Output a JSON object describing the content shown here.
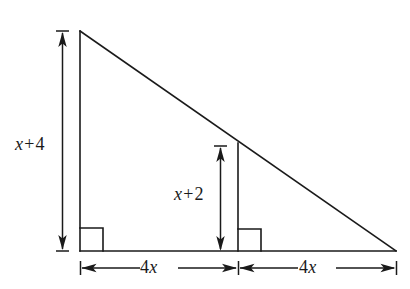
{
  "figure": {
    "kind": "geometry-diagram",
    "background_color": "#ffffff",
    "stroke_color": "#1a1a1a",
    "labels": {
      "left_height": {
        "var": "x",
        "op": "+",
        "num": "4",
        "full": "x + 4"
      },
      "inner_height": {
        "var": "x",
        "op": "+",
        "num": "2",
        "full": "x + 2"
      },
      "base_left": {
        "coef": "4",
        "var": "x",
        "full": "4x"
      },
      "base_right": {
        "coef": "4",
        "var": "x",
        "full": "4x"
      }
    },
    "geometry": {
      "triangle": {
        "apex": [
          80,
          31
        ],
        "bottom_left": [
          80,
          251
        ],
        "bottom_right": [
          396,
          251
        ]
      },
      "altitude": {
        "x": 238,
        "top_y": 143,
        "bottom_y": 251
      },
      "right_angle_marks": [
        {
          "x": 80,
          "y": 251,
          "size": 23,
          "direction": "right"
        },
        {
          "x": 238,
          "y": 251,
          "size": 23,
          "direction": "right"
        }
      ],
      "dimension_lines": [
        {
          "name": "left-height",
          "orientation": "vertical",
          "x": 62,
          "from": 31,
          "to": 251
        },
        {
          "name": "inner-height",
          "orientation": "vertical",
          "x": 220,
          "from": 146,
          "to": 251
        },
        {
          "name": "base-left",
          "orientation": "horizontal",
          "y": 268,
          "from": 80,
          "to": 238
        },
        {
          "name": "base-right",
          "orientation": "horizontal",
          "y": 268,
          "from": 238,
          "to": 396
        }
      ]
    }
  }
}
